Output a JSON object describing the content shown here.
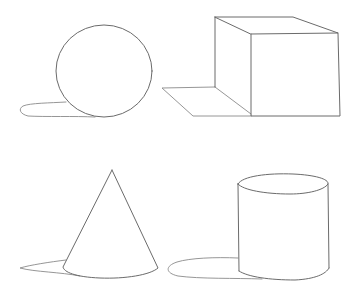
{
  "figure": {
    "background": "#ffffff",
    "line_color": "#6b6b6b",
    "shapes": [
      {
        "name": "sphere",
        "position": "top-left",
        "has_shadow": true
      },
      {
        "name": "cube",
        "position": "top-right",
        "has_shadow": true
      },
      {
        "name": "cone",
        "position": "bottom-left",
        "has_shadow": true
      },
      {
        "name": "cylinder",
        "position": "bottom-right",
        "has_shadow": true
      }
    ]
  }
}
